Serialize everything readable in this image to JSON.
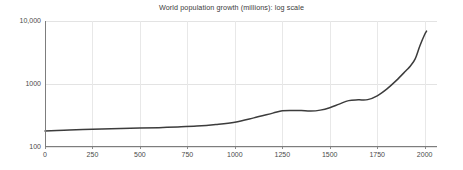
{
  "chart_data": {
    "type": "line",
    "title": "World population growth (millions): log scale",
    "xlabel": "",
    "ylabel": "",
    "yscale": "log",
    "xlim": [
      0,
      2065
    ],
    "ylim": [
      100,
      10000
    ],
    "grid": true,
    "legend": null,
    "xticks": [
      0,
      250,
      500,
      750,
      1000,
      1250,
      1500,
      1750,
      2000
    ],
    "xtick_labels": [
      "0",
      "250",
      "500",
      "750",
      "1000",
      "1250",
      "1500",
      "1750",
      "2000"
    ],
    "yticks": [
      100,
      1000,
      10000
    ],
    "ytick_labels": [
      "100",
      "1000",
      "10,000"
    ],
    "series": [
      {
        "name": "World population",
        "line_color": "#3c3c3c",
        "line_width": 1.5,
        "x": [
          0,
          100,
          200,
          300,
          400,
          500,
          600,
          700,
          800,
          900,
          1000,
          1100,
          1200,
          1250,
          1300,
          1350,
          1400,
          1450,
          1500,
          1550,
          1600,
          1650,
          1700,
          1750,
          1800,
          1850,
          1900,
          1925,
          1950,
          1975,
          2000,
          2010
        ],
        "y": [
          180,
          185,
          190,
          193,
          196,
          200,
          203,
          208,
          215,
          228,
          248,
          290,
          345,
          375,
          380,
          378,
          372,
          385,
          420,
          480,
          545,
          560,
          565,
          650,
          830,
          1130,
          1610,
          1930,
          2500,
          4050,
          6100,
          6900
        ]
      }
    ]
  },
  "axes": {
    "y_tick_positions_px": [
      21,
      84,
      147
    ],
    "x_tick_positions_px": [
      45,
      92,
      140,
      187,
      235,
      282,
      330,
      377,
      424
    ]
  }
}
